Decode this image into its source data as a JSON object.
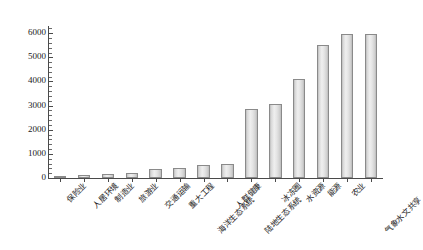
{
  "chart_data": {
    "type": "bar",
    "title": "",
    "xlabel": "",
    "ylabel": "已有的文献数量/篇",
    "ylim": [
      0,
      6300
    ],
    "yticks": [
      0,
      1000,
      2000,
      3000,
      4000,
      5000,
      6000
    ],
    "ytick_labels": [
      "0",
      "1000",
      "2000",
      "3000",
      "4000",
      "5000",
      "6000"
    ],
    "minor_tick_step": 200,
    "grid": false,
    "legend": null,
    "bar_fill_color": "#e4e4e4",
    "bar_edge_color": "#8a8a8a",
    "axis_color": "#4a4a4a",
    "categories": [
      "保险业",
      "人居环境",
      "制造业",
      "旅游业",
      "交通运输",
      "重大工程",
      "海洋生态系统",
      "人群健康",
      "陆地生态系统",
      "冰冻圈",
      "水资源",
      "能源",
      "农业",
      "气象水文共享"
    ],
    "values": [
      20,
      130,
      180,
      190,
      390,
      410,
      560,
      600,
      2850,
      3050,
      4100,
      5500,
      5950,
      5950
    ]
  }
}
